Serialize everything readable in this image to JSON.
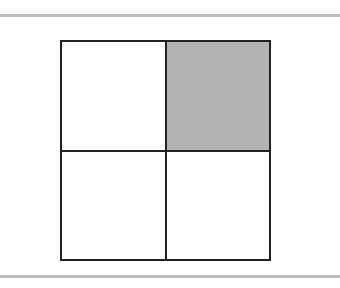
{
  "diagram": {
    "type": "2x2 grid",
    "rows": 2,
    "cols": 2,
    "cells": [
      {
        "row": 0,
        "col": 0,
        "fill": "#ffffff",
        "shaded": false
      },
      {
        "row": 0,
        "col": 1,
        "fill": "#b3b3b3",
        "shaded": true
      },
      {
        "row": 1,
        "col": 0,
        "fill": "#ffffff",
        "shaded": false
      },
      {
        "row": 1,
        "col": 1,
        "fill": "#ffffff",
        "shaded": false
      }
    ],
    "border_color": "#222222",
    "rule_color": "#bdbdbd"
  }
}
